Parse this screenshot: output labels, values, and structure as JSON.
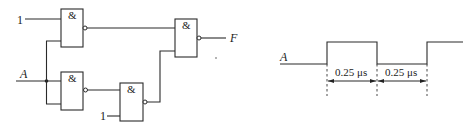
{
  "circuit": {
    "gate_symbol": "&",
    "gates": [
      {
        "id": "G1",
        "type": "NAND",
        "symbol": "&"
      },
      {
        "id": "G2",
        "type": "NAND",
        "symbol": "&"
      },
      {
        "id": "G3",
        "type": "NAND",
        "symbol": "&"
      },
      {
        "id": "G4",
        "type": "NAND",
        "symbol": "&"
      }
    ],
    "inputs": {
      "constant_top": "1",
      "constant_bottom": "1",
      "signal": "A"
    },
    "output": "F",
    "stray_mark": "*"
  },
  "waveform": {
    "signal_label": "A",
    "intervals": [
      {
        "label": "0.25 μs"
      },
      {
        "label": "0.25 μs"
      }
    ]
  }
}
